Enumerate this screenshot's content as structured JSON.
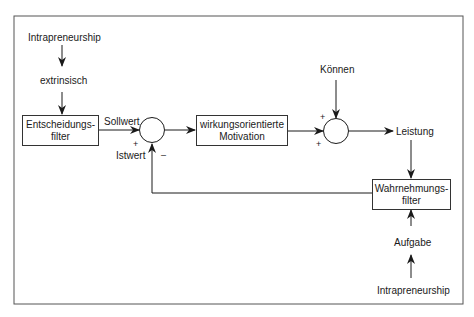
{
  "diagram": {
    "nodes": {
      "intrapreneurship_top": "Intrapreneurship",
      "extrinsisch": "extrinsisch",
      "entscheidungsfilter": {
        "line1": "Entscheidungs-",
        "line2": "filter"
      },
      "motivation": {
        "line1": "wirkungsorientierte",
        "line2": "Motivation"
      },
      "koennen": "Können",
      "leistung": "Leistung",
      "wahrnehmungsfilter": {
        "line1": "Wahrnehmungs-",
        "line2": "filter"
      },
      "aufgabe": "Aufgabe",
      "intrapreneurship_bottom": "Intrapreneurship"
    },
    "labels": {
      "sollwert": "Sollwert",
      "istwert": "Istwert"
    },
    "signs": {
      "sum1_plus": "+",
      "sum1_minus": "–",
      "sum2_plus_top": "+",
      "sum2_plus_bottom": "+"
    },
    "colors": {
      "line": "#1a1a1a",
      "frame": "#555555",
      "background": "#ffffff"
    }
  }
}
